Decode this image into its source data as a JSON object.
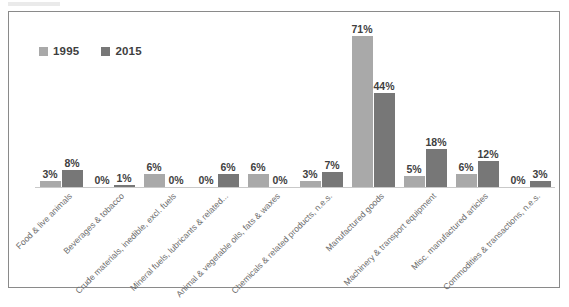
{
  "chart_data": {
    "type": "bar",
    "title": "",
    "subtitle": "",
    "xlabel": "",
    "ylabel": "",
    "ylim": [
      0,
      71
    ],
    "grid": false,
    "legend_position": "top-left",
    "value_suffix": "%",
    "categories": [
      "Food & live animals",
      "Beverages & tobacco",
      "Crude materials, inedible, excl. fuels",
      "Mineral fuels, lubricants & related...",
      "Animal & vegetable oils, fats & waxes",
      "Chemicals & related products, n.e.s.",
      "Manufactured goods",
      "Machinery & transport equipment",
      "Misc. manufactured articles",
      "Commodities & transactions, n.e.s."
    ],
    "series": [
      {
        "name": "1995",
        "color": "#a9a9a9",
        "values": [
          3,
          0,
          6,
          0,
          6,
          3,
          71,
          5,
          6,
          0
        ],
        "labels": [
          "3%",
          "0%",
          "6%",
          "0%",
          "6%",
          "3%",
          "71%",
          "5%",
          "6%",
          "0%"
        ]
      },
      {
        "name": "2015",
        "color": "#777777",
        "values": [
          8,
          1,
          0,
          6,
          0,
          7,
          44,
          18,
          12,
          3
        ],
        "labels": [
          "8%",
          "1%",
          "0%",
          "6%",
          "0%",
          "7%",
          "44%",
          "18%",
          "12%",
          "3%"
        ]
      }
    ]
  },
  "legend": {
    "items": [
      {
        "label": "1995",
        "color": "#a9a9a9"
      },
      {
        "label": "2015",
        "color": "#777777"
      }
    ]
  }
}
